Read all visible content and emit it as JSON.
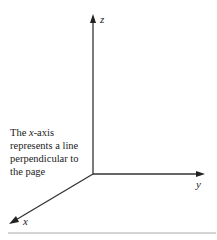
{
  "diagram": {
    "axes": {
      "z_label": "z",
      "y_label": "y",
      "x_label": "x"
    },
    "caption_parts": {
      "prefix": "The ",
      "italic": "x",
      "suffix": "-axis represents a line perpendicular to the page"
    }
  }
}
